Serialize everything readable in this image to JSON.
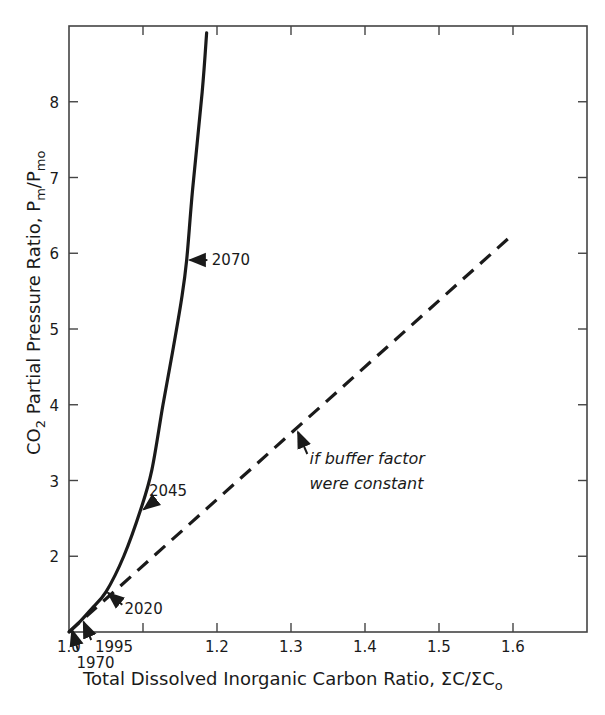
{
  "chart_data": {
    "type": "line",
    "title": "",
    "xlabel": "Total Dissolved Inorganic Carbon Ratio, ΣC/ΣCₒ",
    "ylabel": "CO₂ Partial Pressure Ratio, Pm/Pmo",
    "xlabel_parts": {
      "main": "Total Dissolved Inorganic Carbon Ratio,  ΣC/ΣC",
      "sub": "o"
    },
    "ylabel_parts": {
      "main": "CO",
      "sub1": "2",
      "mid": " Partial Pressure Ratio,  P",
      "sub2": "m",
      "slash": "/P",
      "sub3": "mo"
    },
    "xlim": [
      1.0,
      1.7
    ],
    "ylim": [
      1.0,
      9.0
    ],
    "x_ticks": [
      1.0,
      1.1,
      1.2,
      1.3,
      1.4,
      1.5,
      1.6
    ],
    "x_tick_labels": [
      "1.0",
      "",
      "1.2",
      "1.3",
      "1.4",
      "1.5",
      "1.6"
    ],
    "y_ticks": [
      2,
      3,
      4,
      5,
      6,
      7,
      8
    ],
    "y_tick_labels": [
      "2",
      "3",
      "4",
      "5",
      "6",
      "7",
      "8"
    ],
    "grid": false,
    "legend": null,
    "series": [
      {
        "name": "Actual (variable buffer factor)",
        "style": "solid",
        "x": [
          1.0,
          1.017,
          1.03,
          1.05,
          1.074,
          1.097,
          1.112,
          1.127,
          1.14,
          1.152,
          1.159,
          1.167,
          1.18,
          1.186
        ],
        "y": [
          1.0,
          1.16,
          1.3,
          1.53,
          2.0,
          2.62,
          3.14,
          4.0,
          4.7,
          5.39,
          5.91,
          6.84,
          8.13,
          8.91
        ]
      },
      {
        "name": "if buffer factor were constant",
        "style": "dashed",
        "x": [
          1.0,
          1.6
        ],
        "y": [
          1.0,
          6.25
        ]
      }
    ],
    "annotations": [
      {
        "text": "1970",
        "x": 1.0,
        "y": 1.0,
        "label_x": 1.01,
        "label_y": 0.14,
        "series": 0
      },
      {
        "text": "1995",
        "x": 1.017,
        "y": 1.16,
        "label_x": 1.045,
        "label_y": 0.72,
        "series": 0
      },
      {
        "text": "2020",
        "x": 1.05,
        "y": 1.53,
        "label_x": 1.078,
        "label_y": 1.12,
        "series": 0
      },
      {
        "text": "2045",
        "x": 1.097,
        "y": 2.62,
        "label_x": 1.11,
        "label_y": 2.82,
        "series": 0
      },
      {
        "text": "2070",
        "x": 1.159,
        "y": 5.91,
        "label_x": 1.205,
        "label_y": 5.86,
        "series": 0
      },
      {
        "text_lines": [
          "if buffer factor",
          "were constant"
        ],
        "x": 1.308,
        "y": 3.67,
        "label_x": 1.325,
        "label_y": 3.3,
        "series": 1
      }
    ]
  },
  "labels": {
    "x_axis_title": "Total Dissolved Inorganic Carbon Ratio,  ΣC/ΣC",
    "x_axis_title_sub": "o",
    "y_axis_co": "CO",
    "y_axis_co_sub": "2",
    "y_axis_mid": " Partial Pressure Ratio,  P",
    "y_axis_m_sub": "m",
    "y_axis_slash": "/P",
    "y_axis_mo_sub": "mo",
    "anno_1970": "1970",
    "anno_1995": "1995",
    "anno_2020": "2020",
    "anno_2045": "2045",
    "anno_2070": "2070",
    "anno_const_line1": "if buffer factor",
    "anno_const_line2": "were constant"
  },
  "colors": {
    "ink": "#1a1a1a",
    "frame": "#444444",
    "background": "#ffffff"
  }
}
